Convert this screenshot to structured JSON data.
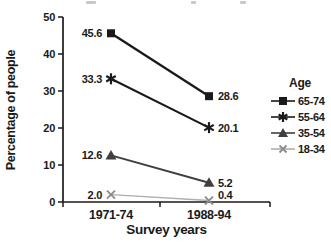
{
  "chart_data": {
    "type": "line",
    "title": "",
    "categories": [
      "1971-74",
      "1988-94"
    ],
    "series": [
      {
        "name": "65-74",
        "marker": "square",
        "color": "#1a1a1a",
        "line_color": "#1a1a1a",
        "line_width": 2.3,
        "values": [
          45.6,
          28.6
        ]
      },
      {
        "name": "55-64",
        "marker": "star",
        "color": "#1a1a1a",
        "line_color": "#1a1a1a",
        "line_width": 2.1,
        "values": [
          33.3,
          20.1
        ]
      },
      {
        "name": "35-54",
        "marker": "triangle",
        "color": "#3f3f3f",
        "line_color": "#3f3f3f",
        "line_width": 2.0,
        "values": [
          12.6,
          5.2
        ]
      },
      {
        "name": "18-34",
        "marker": "xcross",
        "color": "#8c8c8c",
        "line_color": "#aeaeae",
        "line_width": 1.3,
        "values": [
          2.0,
          0.4
        ]
      }
    ],
    "xlabel": "Survey years",
    "ylabel": "Percentage of people",
    "ylim": [
      0,
      50
    ],
    "yticks": [
      0,
      10,
      20,
      30,
      40,
      50
    ],
    "legend_title": "Age",
    "legend_position": "right",
    "data_labels": true,
    "grid": false,
    "axis_color": "#1a1a1a",
    "label_color": "#111111"
  }
}
